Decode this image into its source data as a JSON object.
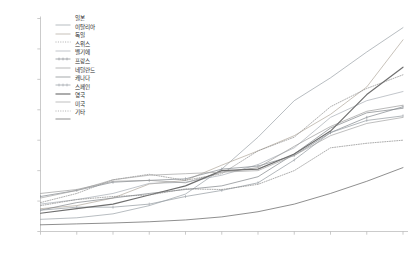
{
  "chart_data": {
    "type": "line",
    "title": "",
    "subtitle": "",
    "xlabel": "",
    "ylabel": "",
    "xlim": [
      1950,
      2050
    ],
    "ylim": [
      5,
      75
    ],
    "yticks": [
      5,
      15,
      25,
      35,
      45,
      55,
      65,
      75
    ],
    "ytick_labels": [
      "5",
      "15",
      "25",
      "35",
      "45",
      "55",
      "65",
      "75"
    ],
    "xticks": [
      1950,
      1960,
      1970,
      1980,
      1990,
      2000,
      2010,
      2020,
      2030,
      2040,
      2050
    ],
    "xtick_labels": [
      "1950",
      "60",
      "70",
      "80",
      "90",
      "2000",
      "10",
      "20",
      "30",
      "40",
      "2050"
    ],
    "grid": false,
    "legend_position": "upper-left-inside",
    "x": [
      1950,
      1960,
      1970,
      1980,
      1990,
      2000,
      2010,
      2020,
      2030,
      2040,
      2050
    ],
    "series": [
      {
        "name": "일본",
        "style": "solid",
        "color": "#9aa0a6",
        "marker": "none",
        "values": [
          9.0,
          9.5,
          10.8,
          13.5,
          17.3,
          25.5,
          36.0,
          48.0,
          55.5,
          64.0,
          72.0
        ]
      },
      {
        "name": "이탈리아",
        "style": "solid",
        "color": "#b0a79c",
        "marker": "none",
        "values": [
          12.5,
          13.5,
          16.0,
          20.6,
          21.8,
          26.8,
          31.5,
          36.5,
          43.5,
          52.5,
          68.0
        ]
      },
      {
        "name": "독일",
        "style": "dotted",
        "color": "#8d8d8d",
        "marker": "none",
        "values": [
          14.5,
          17.5,
          22.0,
          23.8,
          21.8,
          24.0,
          31.5,
          36.0,
          46.0,
          52.0,
          56.5
        ]
      },
      {
        "name": "스위스",
        "style": "solid",
        "color": "#a8aeb4",
        "marker": "none",
        "values": [
          14.0,
          15.5,
          17.5,
          20.8,
          21.2,
          23.5,
          27.0,
          32.5,
          42.5,
          48.0,
          51.0
        ]
      },
      {
        "name": "벨기에",
        "style": "solid-marker",
        "color": "#8a8f94",
        "marker": "tick",
        "values": [
          16.5,
          18.5,
          21.2,
          21.8,
          22.3,
          25.5,
          26.5,
          30.0,
          37.5,
          42.5,
          46.0
        ]
      },
      {
        "name": "프랑스",
        "style": "solid",
        "color": "#9c9c9c",
        "marker": "none",
        "values": [
          17.5,
          18.8,
          21.5,
          21.8,
          21.0,
          24.5,
          26.0,
          33.0,
          39.5,
          44.5,
          46.5
        ]
      },
      {
        "name": "네덜란드",
        "style": "solid",
        "color": "#7f8488",
        "marker": "none",
        "values": [
          12.0,
          14.5,
          16.0,
          17.5,
          18.8,
          20.0,
          23.0,
          30.5,
          39.0,
          44.0,
          45.5
        ]
      },
      {
        "name": "캐나다",
        "style": "solid-marker",
        "color": "#9aa0a6",
        "marker": "tick",
        "values": [
          12.0,
          13.0,
          13.0,
          14.0,
          16.5,
          18.5,
          21.0,
          28.5,
          37.5,
          41.5,
          43.0
        ]
      },
      {
        "name": "스페인",
        "style": "solid-bold",
        "color": "#6e6e6e",
        "marker": "none",
        "values": [
          11.0,
          12.5,
          14.0,
          17.0,
          20.0,
          25.0,
          25.5,
          30.5,
          38.0,
          50.0,
          59.0
        ]
      },
      {
        "name": "영국",
        "style": "solid",
        "color": "#a3a3a3",
        "marker": "none",
        "values": [
          16.0,
          18.5,
          22.0,
          23.5,
          24.0,
          24.5,
          25.0,
          30.0,
          36.5,
          40.5,
          42.5
        ]
      },
      {
        "name": "미국",
        "style": "dotted",
        "color": "#8a8a8a",
        "marker": "none",
        "values": [
          13.5,
          15.5,
          16.5,
          17.0,
          19.0,
          18.8,
          20.5,
          25.0,
          32.5,
          34.0,
          35.0
        ]
      },
      {
        "name": "기타",
        "style": "solid",
        "color": "#5f5f5f",
        "marker": "none",
        "values": [
          7.2,
          7.5,
          7.8,
          8.2,
          8.8,
          9.8,
          11.5,
          14.0,
          17.5,
          21.5,
          26.0
        ]
      }
    ]
  }
}
